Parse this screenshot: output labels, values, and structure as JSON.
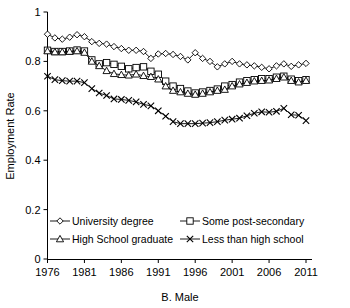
{
  "chart_data": {
    "type": "line",
    "title": "",
    "xlabel": "B. Male",
    "ylabel": "Employment Rate",
    "xlim": [
      1976,
      2011
    ],
    "ylim": [
      0,
      1
    ],
    "grid": false,
    "legend_position": "inside-lower-center",
    "xticks": [
      1976,
      1981,
      1986,
      1991,
      1996,
      2001,
      2006,
      2011
    ],
    "yticks": [
      0,
      0.2,
      0.4,
      0.6,
      0.8,
      1
    ],
    "ytick_labels": [
      "0",
      "0.2",
      "0.4",
      "0.6",
      "0.8",
      "1"
    ],
    "x": [
      1976,
      1977,
      1978,
      1979,
      1980,
      1981,
      1982,
      1983,
      1984,
      1985,
      1986,
      1987,
      1988,
      1989,
      1990,
      1991,
      1992,
      1993,
      1994,
      1995,
      1996,
      1997,
      1998,
      1999,
      2000,
      2001,
      2002,
      2003,
      2004,
      2005,
      2006,
      2007,
      2008,
      2009,
      2010,
      2011
    ],
    "series": [
      {
        "name": "University degree",
        "marker": "diamond",
        "values": [
          0.91,
          0.895,
          0.89,
          0.898,
          0.908,
          0.9,
          0.88,
          0.873,
          0.87,
          0.86,
          0.852,
          0.845,
          0.845,
          0.84,
          0.812,
          0.83,
          0.832,
          0.828,
          0.82,
          0.806,
          0.835,
          0.812,
          0.8,
          0.778,
          0.79,
          0.8,
          0.79,
          0.786,
          0.782,
          0.776,
          0.77,
          0.782,
          0.79,
          0.78,
          0.786,
          0.792
        ]
      },
      {
        "name": "Some post-secondary",
        "marker": "square",
        "values": [
          0.845,
          0.84,
          0.84,
          0.842,
          0.846,
          0.842,
          0.806,
          0.79,
          0.795,
          0.788,
          0.78,
          0.77,
          0.775,
          0.778,
          0.76,
          0.748,
          0.72,
          0.7,
          0.69,
          0.68,
          0.672,
          0.676,
          0.682,
          0.688,
          0.7,
          0.706,
          0.716,
          0.722,
          0.726,
          0.73,
          0.73,
          0.736,
          0.74,
          0.728,
          0.722,
          0.726
        ]
      },
      {
        "name": "High School graduate",
        "marker": "triangle",
        "values": [
          0.842,
          0.838,
          0.838,
          0.84,
          0.842,
          0.836,
          0.8,
          0.782,
          0.762,
          0.75,
          0.746,
          0.744,
          0.748,
          0.742,
          0.738,
          0.728,
          0.7,
          0.682,
          0.676,
          0.67,
          0.666,
          0.67,
          0.676,
          0.682,
          0.686,
          0.7,
          0.708,
          0.714,
          0.72,
          0.722,
          0.724,
          0.73,
          0.736,
          0.722,
          0.716,
          0.722
        ]
      },
      {
        "name": "Less than high school",
        "marker": "x",
        "values": [
          0.74,
          0.726,
          0.722,
          0.72,
          0.72,
          0.714,
          0.69,
          0.672,
          0.662,
          0.648,
          0.646,
          0.642,
          0.636,
          0.626,
          0.62,
          0.6,
          0.578,
          0.556,
          0.548,
          0.548,
          0.548,
          0.55,
          0.552,
          0.556,
          0.562,
          0.566,
          0.57,
          0.58,
          0.59,
          0.596,
          0.594,
          0.598,
          0.61,
          0.584,
          0.582,
          0.56
        ]
      }
    ],
    "legend_entries": [
      {
        "label": "University degree",
        "marker": "diamond"
      },
      {
        "label": "Some post-secondary",
        "marker": "square"
      },
      {
        "label": "High School graduate",
        "marker": "triangle"
      },
      {
        "label": "Less than high school",
        "marker": "x"
      }
    ]
  }
}
